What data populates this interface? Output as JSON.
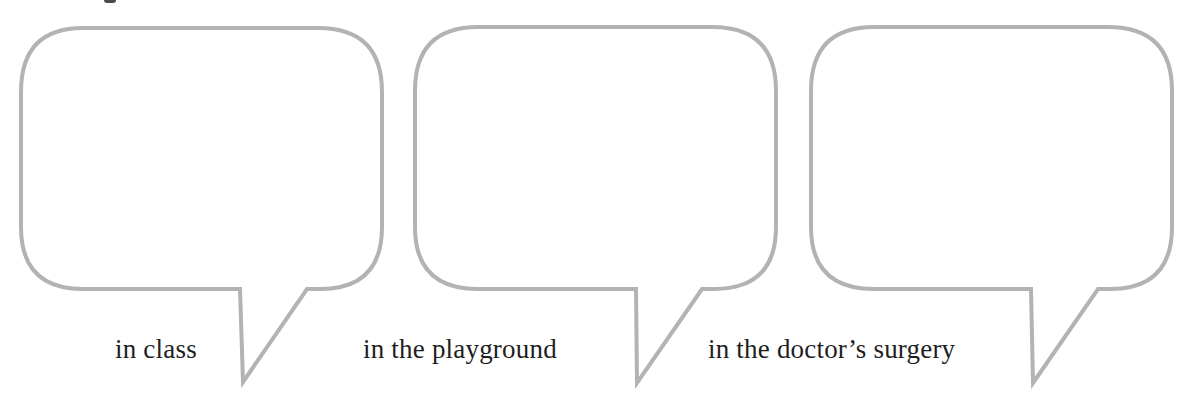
{
  "worksheet": {
    "bubbles": [
      {
        "id": "bubble-1",
        "caption": "in class",
        "answer": ""
      },
      {
        "id": "bubble-2",
        "caption": "in the playground",
        "answer": ""
      },
      {
        "id": "bubble-3",
        "caption": "in the doctor’s surgery",
        "answer": ""
      }
    ],
    "colors": {
      "bubble_stroke": "#b3b3b3",
      "text": "#1e1e1e",
      "background": "#ffffff"
    }
  }
}
